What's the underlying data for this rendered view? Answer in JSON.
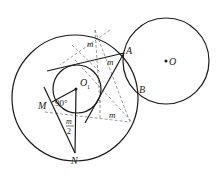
{
  "diagram": {
    "colors": {
      "stroke": "#1a1a1a",
      "dashed": "#555555",
      "background": "#ffffff"
    },
    "points": {
      "O": {
        "label": "O",
        "x": 166,
        "y": 61
      },
      "O1": {
        "label": "O",
        "sub": "1",
        "x": 76,
        "y": 89
      },
      "A": {
        "label": "A",
        "x": 124,
        "y": 53
      },
      "B": {
        "label": "B",
        "x": 137,
        "y": 87
      },
      "M": {
        "label": "M",
        "x": 49,
        "y": 103
      },
      "N": {
        "label": "N",
        "x": 75,
        "y": 153
      }
    },
    "circles": [
      {
        "name": "big-circle",
        "cx": 75,
        "cy": 98,
        "r": 63
      },
      {
        "name": "circle-O",
        "cx": 166,
        "cy": 61,
        "r": 43
      },
      {
        "name": "circle-O1",
        "cx": 77,
        "cy": 89,
        "r": 24
      }
    ],
    "angle_labels": {
      "top_m": "m",
      "a_m": "m",
      "right_m": "m",
      "right_angle": "90°",
      "half_num": "m",
      "half_den": "2"
    }
  }
}
